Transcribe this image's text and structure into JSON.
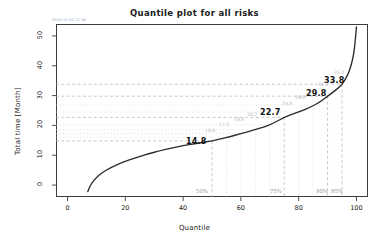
{
  "chart_data": {
    "type": "line",
    "title": "Quantile plot for all risks",
    "xlabel": "Quantile",
    "ylabel": "Total time [Month]",
    "xlim": [
      -4,
      104
    ],
    "ylim": [
      -4,
      54
    ],
    "xticks": [
      0,
      20,
      40,
      60,
      80,
      100
    ],
    "yticks": [
      0,
      10,
      20,
      30,
      40,
      50
    ],
    "grid": false,
    "legend": null,
    "curve_label": "cumulative quantile curve",
    "x": [
      7,
      8,
      10,
      12,
      15,
      18,
      21,
      25,
      28,
      32,
      36,
      40,
      44,
      48,
      50,
      53,
      56,
      60,
      64,
      68,
      71,
      75,
      78,
      81,
      84,
      87,
      90,
      92,
      94,
      95,
      96,
      97,
      98,
      99,
      99.5,
      100
    ],
    "y": [
      -2.2,
      0.2,
      2.6,
      4.2,
      5.9,
      7.2,
      8.3,
      9.6,
      10.5,
      11.5,
      12.4,
      13.2,
      13.9,
      14.5,
      14.8,
      15.5,
      16.2,
      17.2,
      18.3,
      19.5,
      20.6,
      22.7,
      23.8,
      24.9,
      26.1,
      27.6,
      29.8,
      31.2,
      32.8,
      33.8,
      35.2,
      37.0,
      39.5,
      43.5,
      47.5,
      53.0
    ],
    "reference_lines": [
      {
        "quantile": 50,
        "value": 14.8,
        "label": "14.8",
        "pct_label": "50%",
        "emphasis": "major"
      },
      {
        "quantile": 55,
        "value": 16.0,
        "label": "16.0",
        "pct_label": "",
        "emphasis": "minor"
      },
      {
        "quantile": 60,
        "value": 17.2,
        "label": "17.2",
        "pct_label": "",
        "emphasis": "minor"
      },
      {
        "quantile": 65,
        "value": 18.6,
        "label": "18.6",
        "pct_label": "",
        "emphasis": "minor"
      },
      {
        "quantile": 70,
        "value": 20.2,
        "label": "20.2",
        "pct_label": "",
        "emphasis": "minor"
      },
      {
        "quantile": 75,
        "value": 22.7,
        "label": "22.7",
        "pct_label": "75%",
        "emphasis": "major"
      },
      {
        "quantile": 80,
        "value": 24.5,
        "label": "24.5",
        "pct_label": "",
        "emphasis": "minor"
      },
      {
        "quantile": 85,
        "value": 26.8,
        "label": "26.8",
        "pct_label": "",
        "emphasis": "minor"
      },
      {
        "quantile": 90,
        "value": 29.8,
        "label": "29.8",
        "pct_label": "90%",
        "emphasis": "major"
      },
      {
        "quantile": 95,
        "value": 33.8,
        "label": "33.8",
        "pct_label": "95%",
        "emphasis": "major"
      }
    ],
    "colors": {
      "curve": "#2b2b2b",
      "frame": "#3c3c3c",
      "gridline_major": "#b0b0b0",
      "gridline_minor": "#d8d8d8",
      "annotation_major": "#111111",
      "annotation_minor": "#b9b9b9",
      "pct_label": "#9a9a9a",
      "stamp": "#8fa9c4"
    }
  },
  "axis": {
    "ytick_labels": [
      "0",
      "10",
      "20",
      "30",
      "40",
      "50"
    ],
    "xtick_labels": [
      "0",
      "20",
      "40",
      "60",
      "80",
      "100"
    ]
  },
  "annotations": {
    "major": [
      {
        "text": "14.8",
        "left": 186,
        "top": 137
      },
      {
        "text": "22.7",
        "left": 260,
        "top": 108
      },
      {
        "text": "29.8",
        "left": 306,
        "top": 89
      },
      {
        "text": "33.8",
        "left": 324,
        "top": 76
      }
    ],
    "minor": [
      {
        "text": "16.0",
        "left": 205,
        "top": 128
      },
      {
        "text": "17.2",
        "left": 219,
        "top": 122
      },
      {
        "text": "18.6",
        "left": 234,
        "top": 117
      },
      {
        "text": "20.2",
        "left": 247,
        "top": 112
      },
      {
        "text": "24.5",
        "left": 282,
        "top": 101
      },
      {
        "text": "26.8",
        "left": 295,
        "top": 95
      },
      {
        "text": "31.2",
        "left": 318,
        "top": 82
      },
      {
        "text": "35.2",
        "left": 334,
        "top": 70
      }
    ]
  },
  "pct_labels": [
    {
      "text": "50%",
      "left": 190,
      "top": 188
    },
    {
      "text": "75%",
      "left": 264,
      "top": 188
    },
    {
      "text": "90%",
      "left": 310,
      "top": 188
    },
    {
      "text": "95%",
      "left": 325,
      "top": 188
    }
  ],
  "stamp": {
    "text": "2019-11-02 12:34"
  }
}
